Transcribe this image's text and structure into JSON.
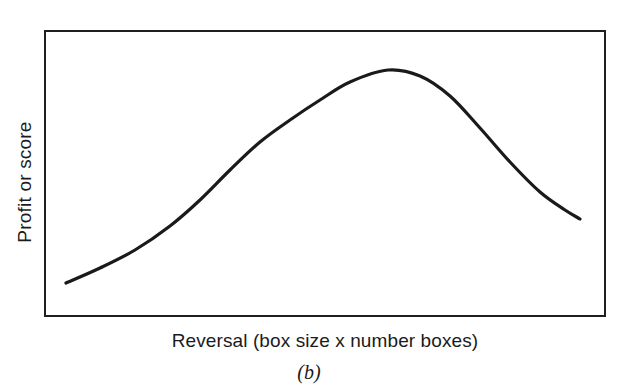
{
  "figure": {
    "caption": "(b)",
    "ylabel": "Profit or score",
    "xlabel": "Reversal (box size x number boxes)"
  },
  "colors": {
    "background": "#ffffff",
    "frame": "#1f1f1f",
    "curve": "#1a1a1a",
    "text": "#1b1b1b"
  },
  "chart_data": {
    "type": "line",
    "title": "",
    "subtitle": "",
    "caption": "(b)",
    "xlabel": "Reversal (box size x number boxes)",
    "ylabel": "Profit or score",
    "grid": false,
    "legend": null,
    "axis_ticks": {
      "x": [],
      "y": []
    },
    "xlim": [
      0,
      1
    ],
    "ylim": [
      0,
      1
    ],
    "series": [
      {
        "name": "Profit or score vs reversal",
        "points_px": [
          [
            66,
            283
          ],
          [
            100,
            268
          ],
          [
            135,
            250
          ],
          [
            170,
            226
          ],
          [
            200,
            200
          ],
          [
            230,
            170
          ],
          [
            260,
            142
          ],
          [
            290,
            120
          ],
          [
            320,
            100
          ],
          [
            350,
            82
          ],
          [
            388,
            70
          ],
          [
            420,
            76
          ],
          [
            450,
            96
          ],
          [
            480,
            128
          ],
          [
            510,
            162
          ],
          [
            540,
            192
          ],
          [
            565,
            210
          ],
          [
            580,
            219
          ]
        ],
        "x_norm": [
          0.0,
          0.06,
          0.13,
          0.2,
          0.26,
          0.32,
          0.38,
          0.44,
          0.49,
          0.55,
          0.63,
          0.69,
          0.75,
          0.81,
          0.86,
          0.92,
          0.97,
          1.0
        ],
        "y_norm": [
          0.07,
          0.13,
          0.2,
          0.29,
          0.38,
          0.49,
          0.59,
          0.68,
          0.75,
          0.82,
          0.86,
          0.84,
          0.77,
          0.65,
          0.52,
          0.41,
          0.35,
          0.31
        ]
      }
    ]
  }
}
